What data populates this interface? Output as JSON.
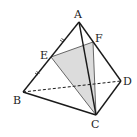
{
  "diagram": {
    "type": "tetrahedron",
    "points": {
      "A": {
        "label": "A",
        "x": 79,
        "y": 22
      },
      "B": {
        "label": "B",
        "x": 23,
        "y": 92
      },
      "C": {
        "label": "C",
        "x": 96,
        "y": 115
      },
      "D": {
        "label": "D",
        "x": 121,
        "y": 81
      },
      "E": {
        "label": "E",
        "x": 51,
        "y": 57
      },
      "F": {
        "label": "F",
        "x": 93,
        "y": 42
      }
    },
    "solid_edges": [
      "AB",
      "AC",
      "AD",
      "BC",
      "CD",
      "EF",
      "EC",
      "FC"
    ],
    "dashed_edges": [
      "BD"
    ],
    "shaded_face": [
      "E",
      "F",
      "C"
    ],
    "tick_marks": [
      "AE",
      "EB"
    ],
    "colors": {
      "line": "#1a1a1a",
      "shade": "#d9d9d9",
      "thin_line": "#444444"
    }
  }
}
